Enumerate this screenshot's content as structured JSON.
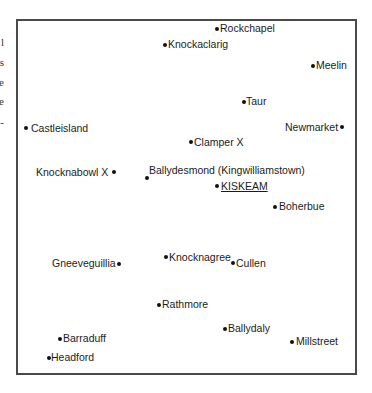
{
  "left_edge_fragments": [
    {
      "text": "l",
      "y": 37
    },
    {
      "text": "s",
      "y": 57
    },
    {
      "text": "e",
      "y": 77
    },
    {
      "text": "e",
      "y": 96
    },
    {
      "text": "-",
      "y": 117
    }
  ],
  "map": {
    "frame": {
      "left": 16,
      "top": 19,
      "right": 355,
      "bottom": 373,
      "border_color": "#4a4a4a"
    },
    "places": [
      {
        "name": "Rockchapel",
        "dot_x": 217,
        "dot_y": 29,
        "label_x": 220,
        "label_y": 22,
        "dot_side": "left",
        "underline": false
      },
      {
        "name": "Knockaclarig",
        "dot_x": 165,
        "dot_y": 45,
        "label_x": 168,
        "label_y": 38,
        "dot_side": "left",
        "underline": false
      },
      {
        "name": "Meelin",
        "dot_x": 313,
        "dot_y": 66,
        "label_x": 316,
        "label_y": 59,
        "dot_side": "left",
        "underline": false
      },
      {
        "name": "Taur",
        "dot_x": 244,
        "dot_y": 102,
        "label_x": 246,
        "label_y": 95,
        "dot_side": "left",
        "underline": false
      },
      {
        "name": "Castleisland",
        "dot_x": 26,
        "dot_y": 128,
        "label_x": 31,
        "label_y": 122,
        "dot_side": "left",
        "underline": false
      },
      {
        "name": "Newmarket",
        "dot_x": 342,
        "dot_y": 127,
        "label_x": 285,
        "label_y": 121,
        "dot_side": "right",
        "underline": false
      },
      {
        "name": "Clamper X",
        "dot_x": 191,
        "dot_y": 142,
        "label_x": 194,
        "label_y": 136,
        "dot_side": "left",
        "underline": false
      },
      {
        "name": "Knocknabowl X",
        "dot_x": 114,
        "dot_y": 172,
        "label_x": 36,
        "label_y": 166,
        "dot_side": "right",
        "underline": false
      },
      {
        "name": "Ballydesmond (Kingwilliamstown)",
        "dot_x": 147,
        "dot_y": 178,
        "label_x": 149,
        "label_y": 164,
        "dot_side": "left",
        "underline": false
      },
      {
        "name": "KISKEAM",
        "dot_x": 217,
        "dot_y": 186,
        "label_x": 221,
        "label_y": 180,
        "dot_side": "left",
        "underline": true
      },
      {
        "name": "Boherbue",
        "dot_x": 275,
        "dot_y": 207,
        "label_x": 279,
        "label_y": 200,
        "dot_side": "left",
        "underline": false
      },
      {
        "name": "Gneeveguillia",
        "dot_x": 119,
        "dot_y": 264,
        "label_x": 52,
        "label_y": 257,
        "dot_side": "right",
        "underline": false
      },
      {
        "name": "Knocknagree",
        "dot_x": 166,
        "dot_y": 257,
        "label_x": 169,
        "label_y": 251,
        "dot_side": "left",
        "underline": false
      },
      {
        "name": "Cullen",
        "dot_x": 233,
        "dot_y": 263,
        "label_x": 236,
        "label_y": 257,
        "dot_side": "left",
        "underline": false
      },
      {
        "name": "Rathmore",
        "dot_x": 159,
        "dot_y": 305,
        "label_x": 162,
        "label_y": 298,
        "dot_side": "left",
        "underline": false
      },
      {
        "name": "Ballydaly",
        "dot_x": 225,
        "dot_y": 329,
        "label_x": 228,
        "label_y": 322,
        "dot_side": "left",
        "underline": false
      },
      {
        "name": "Millstreet",
        "dot_x": 292,
        "dot_y": 342,
        "label_x": 296,
        "label_y": 335,
        "dot_side": "left",
        "underline": false
      },
      {
        "name": "Barraduff",
        "dot_x": 60,
        "dot_y": 339,
        "label_x": 63,
        "label_y": 332,
        "dot_side": "left",
        "underline": false
      },
      {
        "name": "Headford",
        "dot_x": 49,
        "dot_y": 358,
        "label_x": 51,
        "label_y": 351,
        "dot_side": "left",
        "underline": false
      }
    ]
  }
}
